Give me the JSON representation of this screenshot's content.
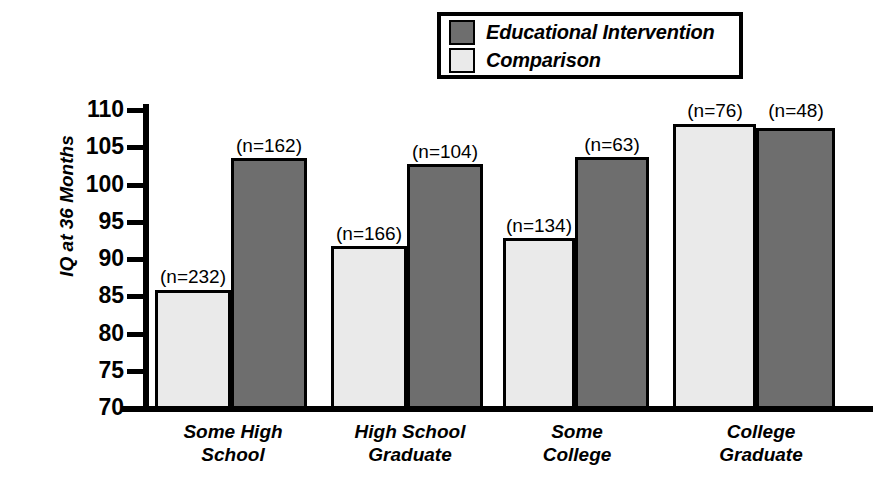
{
  "legend": {
    "items": [
      {
        "label": "Educational Intervention",
        "swatch_color": "#6e6e6e",
        "series": "intervention"
      },
      {
        "label": "Comparison",
        "swatch_color": "#eaeaea",
        "series": "comparison"
      }
    ]
  },
  "axes": {
    "y_title": "IQ at 36 Months",
    "y_ticks": [
      "110",
      "105",
      "100",
      "95",
      "90",
      "85",
      "80",
      "75",
      "70"
    ]
  },
  "chart_data": {
    "type": "bar",
    "title": "",
    "xlabel": "",
    "ylabel": "IQ at 36 Months",
    "ylim": [
      70,
      110
    ],
    "ytick_step": 5,
    "grid": false,
    "legend_position": "top-right",
    "categories": [
      "Some High\nSchool",
      "High School\nGraduate",
      "Some\nCollege",
      "College\nGraduate"
    ],
    "series": [
      {
        "name": "Comparison",
        "color": "#eaeaea",
        "values": [
          86,
          92,
          93,
          108.5
        ],
        "n_labels": [
          "(n=232)",
          "(n=166)",
          "(n=134)",
          "(n=76)"
        ]
      },
      {
        "name": "Educational Intervention",
        "color": "#6e6e6e",
        "values": [
          103.5,
          103,
          104,
          108
        ],
        "n_labels": [
          "(n=162)",
          "(n=104)",
          "(n=63)",
          "(n=48)"
        ]
      }
    ]
  },
  "bars": [
    {
      "group": 0,
      "series": "comparison",
      "value": 86,
      "n_label": "(n=232)",
      "x": 155,
      "width": 76,
      "top": 290,
      "color": "#eaeaea",
      "label_x": 145,
      "label_y": 267,
      "label_w": 96
    },
    {
      "group": 0,
      "series": "intervention",
      "value": 103.5,
      "n_label": "(n=162)",
      "x": 231,
      "width": 76,
      "top": 158,
      "color": "#6e6e6e",
      "label_x": 221,
      "label_y": 136,
      "label_w": 96
    },
    {
      "group": 1,
      "series": "comparison",
      "value": 92,
      "n_label": "(n=166)",
      "x": 331,
      "width": 76,
      "top": 246,
      "color": "#eaeaea",
      "label_x": 321,
      "label_y": 224,
      "label_w": 96
    },
    {
      "group": 1,
      "series": "intervention",
      "value": 103,
      "n_label": "(n=104)",
      "x": 407,
      "width": 76,
      "top": 164,
      "color": "#6e6e6e",
      "label_x": 397,
      "label_y": 142,
      "label_w": 96
    },
    {
      "group": 2,
      "series": "comparison",
      "value": 93,
      "n_label": "(n=134)",
      "x": 503,
      "width": 72,
      "top": 238,
      "color": "#eaeaea",
      "label_x": 491,
      "label_y": 216,
      "label_w": 96
    },
    {
      "group": 2,
      "series": "intervention",
      "value": 104,
      "n_label": "(n=63)",
      "x": 575,
      "width": 74,
      "top": 157,
      "color": "#6e6e6e",
      "label_x": 568,
      "label_y": 135,
      "label_w": 88
    },
    {
      "group": 3,
      "series": "comparison",
      "value": 108.5,
      "n_label": "(n=76)",
      "x": 673,
      "width": 83,
      "top": 124,
      "color": "#eaeaea",
      "label_x": 671,
      "label_y": 101,
      "label_w": 88
    },
    {
      "group": 3,
      "series": "intervention",
      "value": 108,
      "n_label": "(n=48)",
      "x": 756,
      "width": 79,
      "top": 128,
      "color": "#6e6e6e",
      "label_x": 752,
      "label_y": 101,
      "label_w": 88
    }
  ],
  "category_labels": [
    {
      "text": "Some High\nSchool",
      "x": 158,
      "width": 150
    },
    {
      "text": "High School\nGraduate",
      "x": 332,
      "width": 156
    },
    {
      "text": "Some\nCollege",
      "x": 512,
      "width": 130
    },
    {
      "text": "College\nGraduate",
      "x": 686,
      "width": 150
    }
  ]
}
